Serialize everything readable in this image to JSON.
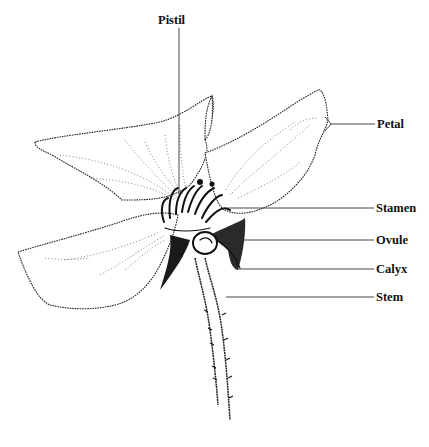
{
  "diagram": {
    "labels": {
      "pistil": "Pistil",
      "petal": "Petal",
      "stamen": "Stamen",
      "ovule": "Ovule",
      "calyx": "Calyx",
      "stem": "Stem"
    },
    "colors": {
      "ink": "#111111",
      "background": "#ffffff"
    }
  }
}
